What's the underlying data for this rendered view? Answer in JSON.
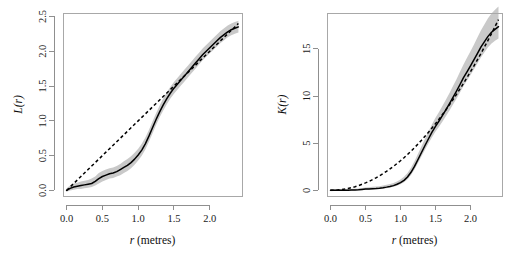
{
  "page": {
    "background": "#ffffff",
    "top_artifact_text": "",
    "width": 511,
    "height": 256
  },
  "colors": {
    "envelope_gray": "#c9c9c9",
    "line_black": "#000000",
    "axis_gray": "#8f8f8f",
    "box_gray": "#a8a8a8"
  },
  "chart_data": [
    {
      "type": "line",
      "panel": "left",
      "title": "",
      "xlabel": "r (metres)",
      "ylabel": "L(r)",
      "xlabel_italic_part": "r",
      "xlabel_rest": " (metres)",
      "xlim": [
        -0.05,
        2.45
      ],
      "ylim": [
        -0.08,
        2.55
      ],
      "grid": false,
      "legend_position": "none",
      "xticks": [
        0.0,
        0.5,
        1.0,
        1.5,
        2.0
      ],
      "xtick_labels": [
        "0.0",
        "0.5",
        "1.0",
        "1.5",
        "2.0"
      ],
      "yticks": [
        0.0,
        0.5,
        1.0,
        1.5,
        2.0,
        2.5
      ],
      "ytick_labels": [
        "0.0",
        "0.5",
        "1.0",
        "1.5",
        "2.0",
        "2.5"
      ],
      "x": [
        0.0,
        0.05,
        0.1,
        0.15,
        0.2,
        0.25,
        0.3,
        0.35,
        0.4,
        0.45,
        0.5,
        0.55,
        0.6,
        0.65,
        0.7,
        0.75,
        0.8,
        0.85,
        0.9,
        0.95,
        1.0,
        1.05,
        1.1,
        1.15,
        1.2,
        1.25,
        1.3,
        1.35,
        1.4,
        1.45,
        1.5,
        1.55,
        1.6,
        1.65,
        1.7,
        1.75,
        1.8,
        1.85,
        1.9,
        1.95,
        2.0,
        2.05,
        2.1,
        2.15,
        2.2,
        2.25,
        2.3,
        2.35,
        2.4
      ],
      "series": [
        {
          "name": "observed L(r)",
          "style": "solid",
          "values": [
            0.0,
            0.03,
            0.05,
            0.06,
            0.07,
            0.08,
            0.09,
            0.1,
            0.13,
            0.17,
            0.2,
            0.22,
            0.24,
            0.25,
            0.27,
            0.3,
            0.33,
            0.36,
            0.4,
            0.45,
            0.51,
            0.58,
            0.67,
            0.78,
            0.9,
            1.02,
            1.13,
            1.23,
            1.32,
            1.4,
            1.47,
            1.53,
            1.59,
            1.65,
            1.71,
            1.77,
            1.83,
            1.89,
            1.95,
            2.0,
            2.05,
            2.1,
            2.15,
            2.2,
            2.24,
            2.28,
            2.31,
            2.33,
            2.35
          ]
        },
        {
          "name": "theoretical L(r) (Poisson)",
          "style": "dashed",
          "values": [
            0.0,
            0.05,
            0.1,
            0.15,
            0.2,
            0.25,
            0.3,
            0.35,
            0.4,
            0.45,
            0.5,
            0.55,
            0.6,
            0.65,
            0.7,
            0.75,
            0.8,
            0.85,
            0.9,
            0.95,
            1.0,
            1.05,
            1.1,
            1.15,
            1.2,
            1.25,
            1.3,
            1.35,
            1.4,
            1.45,
            1.5,
            1.55,
            1.6,
            1.65,
            1.7,
            1.75,
            1.8,
            1.85,
            1.9,
            1.95,
            2.0,
            2.05,
            2.1,
            2.15,
            2.2,
            2.25,
            2.3,
            2.35,
            2.4
          ]
        }
      ],
      "envelope": {
        "name": "simulation envelope",
        "lower": [
          -0.02,
          0.0,
          0.01,
          0.02,
          0.02,
          0.03,
          0.04,
          0.05,
          0.07,
          0.1,
          0.13,
          0.15,
          0.17,
          0.18,
          0.2,
          0.22,
          0.25,
          0.28,
          0.32,
          0.37,
          0.43,
          0.5,
          0.59,
          0.7,
          0.82,
          0.94,
          1.05,
          1.15,
          1.24,
          1.32,
          1.39,
          1.45,
          1.51,
          1.57,
          1.63,
          1.69,
          1.75,
          1.81,
          1.87,
          1.92,
          1.97,
          2.02,
          2.07,
          2.12,
          2.16,
          2.2,
          2.23,
          2.25,
          2.27
        ],
        "upper": [
          0.03,
          0.07,
          0.1,
          0.11,
          0.13,
          0.14,
          0.15,
          0.17,
          0.2,
          0.25,
          0.28,
          0.3,
          0.32,
          0.33,
          0.35,
          0.38,
          0.42,
          0.45,
          0.49,
          0.54,
          0.6,
          0.67,
          0.76,
          0.87,
          0.99,
          1.11,
          1.22,
          1.32,
          1.41,
          1.49,
          1.56,
          1.62,
          1.68,
          1.74,
          1.8,
          1.86,
          1.92,
          1.98,
          2.04,
          2.09,
          2.14,
          2.19,
          2.24,
          2.29,
          2.33,
          2.37,
          2.4,
          2.42,
          2.44
        ]
      }
    },
    {
      "type": "line",
      "panel": "right",
      "title": "",
      "xlabel": "r (metres)",
      "ylabel": "K(r)",
      "xlabel_italic_part": "r",
      "xlabel_rest": " (metres)",
      "xlim": [
        -0.05,
        2.45
      ],
      "ylim": [
        -0.6,
        18.8
      ],
      "grid": false,
      "legend_position": "none",
      "xticks": [
        0.0,
        0.5,
        1.0,
        1.5,
        2.0
      ],
      "xtick_labels": [
        "0.0",
        "0.5",
        "1.0",
        "1.5",
        "2.0"
      ],
      "yticks": [
        0,
        5,
        10,
        15
      ],
      "ytick_labels": [
        "0",
        "5",
        "10",
        "15"
      ],
      "x": [
        0.0,
        0.05,
        0.1,
        0.15,
        0.2,
        0.25,
        0.3,
        0.35,
        0.4,
        0.45,
        0.5,
        0.55,
        0.6,
        0.65,
        0.7,
        0.75,
        0.8,
        0.85,
        0.9,
        0.95,
        1.0,
        1.05,
        1.1,
        1.15,
        1.2,
        1.25,
        1.3,
        1.35,
        1.4,
        1.45,
        1.5,
        1.55,
        1.6,
        1.65,
        1.7,
        1.75,
        1.8,
        1.85,
        1.9,
        1.95,
        2.0,
        2.05,
        2.1,
        2.15,
        2.2,
        2.25,
        2.3,
        2.35,
        2.4
      ],
      "series": [
        {
          "name": "observed K(r)",
          "style": "solid",
          "values": [
            0.0,
            0.0,
            0.01,
            0.01,
            0.02,
            0.02,
            0.03,
            0.03,
            0.05,
            0.09,
            0.13,
            0.15,
            0.18,
            0.2,
            0.23,
            0.28,
            0.34,
            0.41,
            0.5,
            0.64,
            0.82,
            1.06,
            1.41,
            1.91,
            2.54,
            3.27,
            4.01,
            4.75,
            5.47,
            6.16,
            6.79,
            7.35,
            7.94,
            8.55,
            9.19,
            9.85,
            10.52,
            11.22,
            11.94,
            12.57,
            13.2,
            13.85,
            14.52,
            15.2,
            15.77,
            16.32,
            16.76,
            17.07,
            17.35
          ]
        },
        {
          "name": "theoretical K(r) (Poisson)",
          "style": "dashed",
          "values": [
            0.0,
            0.01,
            0.03,
            0.07,
            0.13,
            0.2,
            0.28,
            0.38,
            0.5,
            0.64,
            0.79,
            0.95,
            1.13,
            1.33,
            1.54,
            1.77,
            2.01,
            2.27,
            2.54,
            2.84,
            3.14,
            3.46,
            3.8,
            4.15,
            4.52,
            4.91,
            5.31,
            5.73,
            6.16,
            6.61,
            7.07,
            7.55,
            8.04,
            8.55,
            9.08,
            9.62,
            10.18,
            10.75,
            11.34,
            11.95,
            12.57,
            13.2,
            13.85,
            14.52,
            15.21,
            15.9,
            16.62,
            17.35,
            18.1
          ]
        }
      ],
      "envelope": {
        "name": "simulation envelope",
        "lower": [
          -0.1,
          -0.08,
          -0.06,
          -0.05,
          -0.04,
          -0.03,
          -0.02,
          -0.02,
          0.0,
          0.03,
          0.06,
          0.08,
          0.1,
          0.12,
          0.14,
          0.18,
          0.23,
          0.29,
          0.37,
          0.49,
          0.64,
          0.85,
          1.17,
          1.63,
          2.22,
          2.91,
          3.61,
          4.31,
          4.99,
          5.64,
          6.23,
          6.75,
          7.3,
          7.87,
          8.47,
          9.09,
          9.72,
          10.38,
          11.06,
          11.65,
          12.24,
          12.85,
          13.48,
          14.12,
          14.65,
          15.16,
          15.57,
          15.85,
          16.1
        ],
        "upper": [
          0.12,
          0.13,
          0.14,
          0.14,
          0.15,
          0.15,
          0.16,
          0.17,
          0.2,
          0.25,
          0.3,
          0.33,
          0.37,
          0.4,
          0.44,
          0.5,
          0.58,
          0.67,
          0.79,
          0.95,
          1.16,
          1.44,
          1.85,
          2.4,
          3.09,
          3.88,
          4.68,
          5.48,
          6.25,
          7.0,
          7.69,
          8.31,
          8.96,
          9.63,
          10.33,
          11.05,
          11.79,
          12.56,
          13.35,
          14.05,
          14.75,
          15.47,
          16.22,
          16.98,
          17.62,
          18.24,
          18.76,
          19.15,
          19.5
        ]
      }
    }
  ]
}
